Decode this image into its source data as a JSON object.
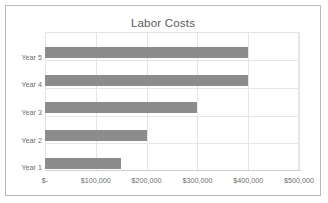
{
  "chart_data": {
    "type": "bar",
    "orientation": "horizontal",
    "title": "Labor Costs",
    "xlabel": "",
    "ylabel": "",
    "categories": [
      "Year 1",
      "Year 2",
      "Year 3",
      "Year 4",
      "Year 5"
    ],
    "values": [
      150000,
      200000,
      300000,
      400000,
      400000
    ],
    "display_order_top_to_bottom": [
      "Year 5",
      "Year 4",
      "Year 3",
      "Year 2",
      "Year 1"
    ],
    "xlim": [
      0,
      500000
    ],
    "xticks": [
      0,
      100000,
      200000,
      300000,
      400000,
      500000
    ],
    "xtick_labels": [
      "$-",
      "$100,000",
      "$200,000",
      "$300,000",
      "$400,000",
      "$500,000"
    ],
    "grid": {
      "vertical": true,
      "horizontal": true
    },
    "legend": null,
    "series": [
      {
        "name": "Labor Costs",
        "color": "#8c8c8c",
        "values": [
          150000,
          200000,
          300000,
          400000,
          400000
        ]
      }
    ],
    "bars_top_to_bottom": [
      {
        "category": "Year 5",
        "value": 400000
      },
      {
        "category": "Year 4",
        "value": 400000
      },
      {
        "category": "Year 3",
        "value": 300000
      },
      {
        "category": "Year 2",
        "value": 200000
      },
      {
        "category": "Year 1",
        "value": 150000
      }
    ]
  },
  "colors": {
    "bar": "#8c8c8c",
    "gridline": "#e6e6e6",
    "text": "#6e6e6e",
    "title_text": "#5a5a5a",
    "frame_border": "#b9b9b9",
    "background": "#ffffff"
  }
}
